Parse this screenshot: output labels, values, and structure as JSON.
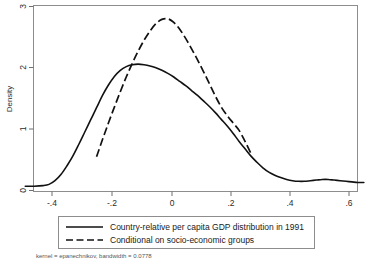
{
  "chart_data": {
    "type": "line",
    "title": "",
    "xlabel": "",
    "ylabel": "Density",
    "xlim": [
      -0.49,
      0.66
    ],
    "ylim": [
      0,
      3
    ],
    "grid": false,
    "legend_position": "bottom",
    "xticks": [
      "-.4",
      "-.2",
      "0",
      ".2",
      ".4",
      ".6"
    ],
    "xtick_values": [
      -0.4,
      -0.2,
      0,
      0.2,
      0.4,
      0.6
    ],
    "yticks": [
      "0",
      "1",
      "2",
      "3"
    ],
    "ytick_values": [
      0,
      1,
      2,
      3
    ],
    "footnote": "kernel = epanechnikov, bandwidth = 0.0778",
    "series": [
      {
        "name": "Country-relative per capita GDP distribution in 1991",
        "style": "solid",
        "color": "#111111",
        "x": [
          -0.49,
          -0.46,
          -0.43,
          -0.41,
          -0.39,
          -0.37,
          -0.35,
          -0.33,
          -0.31,
          -0.29,
          -0.27,
          -0.25,
          -0.23,
          -0.21,
          -0.19,
          -0.17,
          -0.15,
          -0.13,
          -0.11,
          -0.09,
          -0.07,
          -0.05,
          -0.03,
          -0.01,
          0.01,
          0.03,
          0.05,
          0.07,
          0.09,
          0.11,
          0.13,
          0.15,
          0.17,
          0.19,
          0.21,
          0.23,
          0.25,
          0.27,
          0.29,
          0.31,
          0.33,
          0.35,
          0.37,
          0.39,
          0.41,
          0.43,
          0.45,
          0.47,
          0.49,
          0.51,
          0.53,
          0.55,
          0.57,
          0.59,
          0.61,
          0.63,
          0.65
        ],
        "y": [
          0.07,
          0.07,
          0.08,
          0.1,
          0.16,
          0.26,
          0.4,
          0.56,
          0.75,
          0.95,
          1.15,
          1.35,
          1.55,
          1.72,
          1.86,
          1.96,
          2.02,
          2.05,
          2.06,
          2.05,
          2.03,
          2.0,
          1.96,
          1.91,
          1.85,
          1.78,
          1.71,
          1.63,
          1.55,
          1.46,
          1.37,
          1.27,
          1.16,
          1.05,
          0.93,
          0.8,
          0.68,
          0.56,
          0.46,
          0.37,
          0.3,
          0.25,
          0.21,
          0.18,
          0.16,
          0.15,
          0.15,
          0.16,
          0.17,
          0.18,
          0.18,
          0.17,
          0.16,
          0.15,
          0.14,
          0.13,
          0.13
        ]
      },
      {
        "name": "Conditional on socio-economic groups",
        "style": "dashed",
        "color": "#111111",
        "x": [
          -0.25,
          -0.23,
          -0.21,
          -0.19,
          -0.17,
          -0.15,
          -0.13,
          -0.11,
          -0.09,
          -0.07,
          -0.05,
          -0.03,
          -0.01,
          0.01,
          0.03,
          0.05,
          0.07,
          0.09,
          0.11,
          0.13,
          0.15,
          0.17,
          0.19,
          0.21,
          0.23,
          0.25,
          0.27
        ],
        "y": [
          0.55,
          0.83,
          1.1,
          1.36,
          1.61,
          1.85,
          2.07,
          2.27,
          2.45,
          2.6,
          2.72,
          2.79,
          2.8,
          2.74,
          2.63,
          2.48,
          2.31,
          2.13,
          1.94,
          1.74,
          1.54,
          1.36,
          1.22,
          1.1,
          0.98,
          0.8,
          0.6
        ]
      }
    ]
  },
  "legend": {
    "entries": [
      {
        "label": "Country-relative per capita GDP distribution in 1991",
        "style": "solid"
      },
      {
        "label": "Conditional on socio-economic groups",
        "style": "dashed"
      }
    ]
  },
  "axes": {
    "y_title": "Density",
    "x_tick_labels": [
      "-.4",
      "-.2",
      "0",
      ".2",
      ".4",
      ".6"
    ],
    "y_tick_labels": [
      "3",
      "2",
      "1",
      "0"
    ]
  },
  "footnote": {
    "text": "kernel = epanechnikov, bandwidth = 0.0778"
  }
}
